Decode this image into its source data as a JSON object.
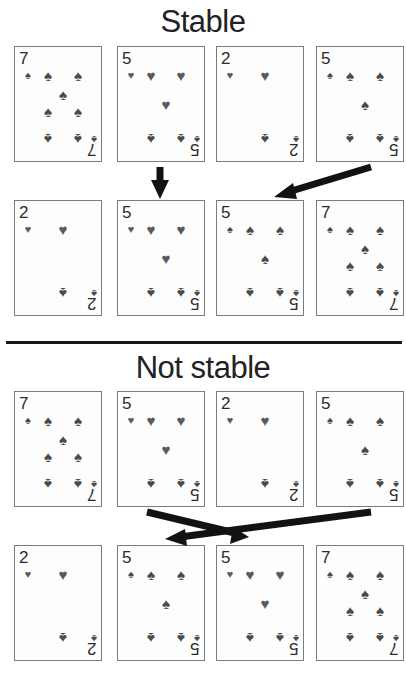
{
  "figure": {
    "sections": [
      {
        "id": "stable",
        "title": "Stable",
        "input_row": {
          "label": "input sequence",
          "cards": [
            {
              "rank": "7",
              "suit": "spade",
              "suit_glyph": "♠",
              "layout": "seven"
            },
            {
              "rank": "5",
              "suit": "heart",
              "suit_glyph": "♥",
              "layout": "five"
            },
            {
              "rank": "2",
              "suit": "heart",
              "suit_glyph": "♥",
              "layout": "two"
            },
            {
              "rank": "5",
              "suit": "spade",
              "suit_glyph": "♠",
              "layout": "five"
            }
          ]
        },
        "output_row": {
          "label": "sorted sequence",
          "cards": [
            {
              "rank": "2",
              "suit": "heart",
              "suit_glyph": "♥",
              "layout": "two"
            },
            {
              "rank": "5",
              "suit": "heart",
              "suit_glyph": "♥",
              "layout": "five"
            },
            {
              "rank": "5",
              "suit": "spade",
              "suit_glyph": "♠",
              "layout": "five"
            },
            {
              "rank": "7",
              "suit": "spade",
              "suit_glyph": "♠",
              "layout": "seven"
            }
          ]
        },
        "arrows": [
          {
            "name": "arrow-five-hearts-straight",
            "from_column": 1,
            "to_column": 1,
            "direction": "down"
          },
          {
            "name": "arrow-five-spades-diagonal",
            "from_column": 3,
            "to_column": 2,
            "direction": "down-left"
          }
        ]
      },
      {
        "id": "not-stable",
        "title": "Not stable",
        "input_row": {
          "label": "input sequence",
          "cards": [
            {
              "rank": "7",
              "suit": "spade",
              "suit_glyph": "♠",
              "layout": "seven"
            },
            {
              "rank": "5",
              "suit": "heart",
              "suit_glyph": "♥",
              "layout": "five"
            },
            {
              "rank": "2",
              "suit": "heart",
              "suit_glyph": "♥",
              "layout": "two"
            },
            {
              "rank": "5",
              "suit": "spade",
              "suit_glyph": "♠",
              "layout": "five"
            }
          ]
        },
        "output_row": {
          "label": "sorted sequence",
          "cards": [
            {
              "rank": "2",
              "suit": "heart",
              "suit_glyph": "♥",
              "layout": "two"
            },
            {
              "rank": "5",
              "suit": "spade",
              "suit_glyph": "♠",
              "layout": "five"
            },
            {
              "rank": "5",
              "suit": "heart",
              "suit_glyph": "♥",
              "layout": "five"
            },
            {
              "rank": "7",
              "suit": "spade",
              "suit_glyph": "♠",
              "layout": "seven"
            }
          ]
        },
        "arrows": [
          {
            "name": "arrow-five-hearts-crossing",
            "from_column": 1,
            "to_column": 2,
            "direction": "down-right"
          },
          {
            "name": "arrow-five-spades-crossing",
            "from_column": 3,
            "to_column": 1,
            "direction": "down-left"
          }
        ]
      }
    ],
    "colors": {
      "ink": "#121212",
      "card_border": "#7c7c7c",
      "card_face": "#fdfdfd",
      "pip_spade": "#4a4a4a",
      "pip_heart": "#5a5a5a",
      "title": "#222222",
      "divider": "#171717"
    }
  }
}
